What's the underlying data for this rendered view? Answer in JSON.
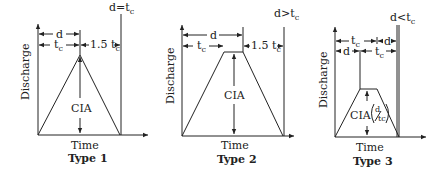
{
  "diagram": {
    "axis_labels": {
      "y": "Discharge",
      "x": "Time"
    },
    "panels": [
      {
        "name": "Type 1",
        "condition": "d=t",
        "condition_sub": "c",
        "peak_label": "CIA",
        "dims": {
          "d": "d",
          "tc": "t",
          "tc_sub": "c",
          "recession": "1.5 t",
          "recession_sub": "c"
        }
      },
      {
        "name": "Type 2",
        "condition": "d>t",
        "condition_sub": "c",
        "peak_label": "CIA",
        "dims": {
          "d": "d",
          "tc": "t",
          "tc_sub": "c",
          "recession": "1.5 t",
          "recession_sub": "c"
        }
      },
      {
        "name": "Type 3",
        "condition": "d<t",
        "condition_sub": "c",
        "peak_label": "CIA",
        "peak_label_fraction": {
          "num": "d",
          "den": "tc"
        },
        "dims": {
          "d": "d",
          "tc": "t",
          "tc_sub": "c"
        }
      }
    ],
    "colors": {
      "line": "#222222",
      "background": "#ffffff"
    }
  }
}
